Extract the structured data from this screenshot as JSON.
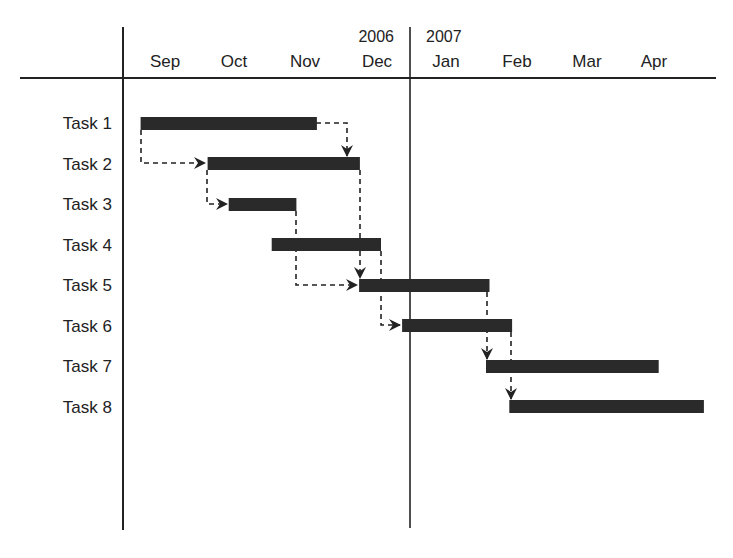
{
  "chart_data": {
    "type": "gantt",
    "title": "",
    "years": [
      {
        "label": "2006",
        "over_month": "Dec"
      },
      {
        "label": "2007",
        "over_month": "Jan"
      }
    ],
    "months": [
      "Sep",
      "Oct",
      "Nov",
      "Dec",
      "Jan",
      "Feb",
      "Mar",
      "Apr"
    ],
    "month_start_x": 130,
    "month_width": 70.5,
    "tasks": [
      {
        "name": "Task 1",
        "start": 0.15,
        "end": 2.65
      },
      {
        "name": "Task 2",
        "start": 1.1,
        "end": 3.26
      },
      {
        "name": "Task 3",
        "start": 1.4,
        "end": 2.36
      },
      {
        "name": "Task 4",
        "start": 2.01,
        "end": 3.56
      },
      {
        "name": "Task 5",
        "start": 3.25,
        "end": 5.1
      },
      {
        "name": "Task 6",
        "start": 3.86,
        "end": 5.42
      },
      {
        "name": "Task 7",
        "start": 5.05,
        "end": 7.5
      },
      {
        "name": "Task 8",
        "start": 5.38,
        "end": 8.14
      }
    ],
    "dependencies": [
      {
        "from": "Task 1",
        "to": "Task 2",
        "type": "start-to-start"
      },
      {
        "from": "Task 1",
        "to": "Task 2",
        "type": "finish-to-finish"
      },
      {
        "from": "Task 2",
        "to": "Task 3",
        "type": "start-to-start"
      },
      {
        "from": "Task 2",
        "to": "Task 5",
        "type": "finish-to-start"
      },
      {
        "from": "Task 3",
        "to": "Task 5",
        "type": "finish-to-start"
      },
      {
        "from": "Task 4",
        "to": "Task 6",
        "type": "finish-to-start"
      },
      {
        "from": "Task 5",
        "to": "Task 7",
        "type": "finish-to-start"
      },
      {
        "from": "Task 6",
        "to": "Task 8",
        "type": "finish-to-start"
      }
    ],
    "bar_color": "#2a2a2a",
    "line_color": "#222222"
  }
}
